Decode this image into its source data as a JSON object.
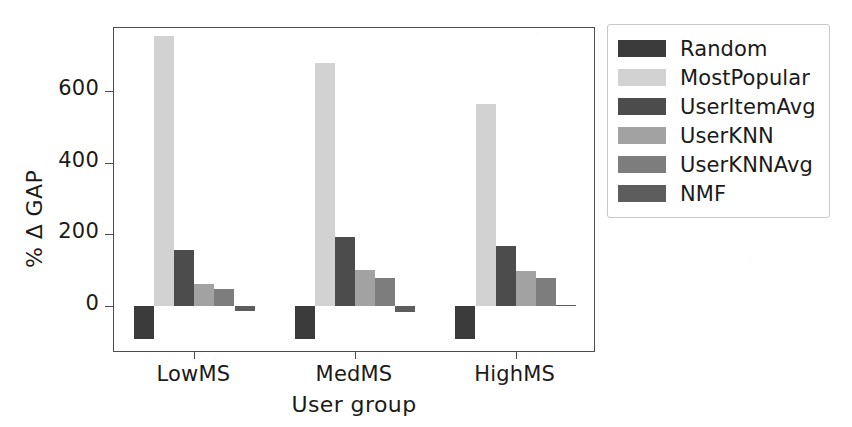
{
  "chart_data": {
    "type": "bar",
    "title": "",
    "xlabel": "User group",
    "ylabel": "% Δ GAP",
    "categories": [
      "LowMS",
      "MedMS",
      "HighMS"
    ],
    "yticks": [
      0,
      200,
      400,
      600
    ],
    "ylim": [
      -130,
      775
    ],
    "grid": false,
    "legend_position": "right-outside",
    "series": [
      {
        "name": "Random",
        "color": "#3b3b3b",
        "values": [
          -92,
          -92,
          -92
        ]
      },
      {
        "name": "MostPopular",
        "color": "#d2d2d2",
        "values": [
          753,
          678,
          564
        ]
      },
      {
        "name": "UserItemAvg",
        "color": "#4c4c4c",
        "values": [
          156,
          192,
          168
        ]
      },
      {
        "name": "UserKNN",
        "color": "#a2a2a2",
        "values": [
          62,
          100,
          97
        ]
      },
      {
        "name": "UserKNNAvg",
        "color": "#7d7d7d",
        "values": [
          48,
          80,
          80
        ]
      },
      {
        "name": "NMF",
        "color": "#5d5d5d",
        "values": [
          -12,
          -16,
          3
        ]
      }
    ]
  },
  "axis": {
    "ytick_labels": [
      "0",
      "200",
      "400",
      "600"
    ],
    "xtick_labels": [
      "LowMS",
      "MedMS",
      "HighMS"
    ],
    "ylabel_text": "% Δ GAP",
    "xlabel_text": "User group"
  },
  "legend": {
    "items": [
      {
        "label": "Random",
        "color": "#3b3b3b"
      },
      {
        "label": "MostPopular",
        "color": "#d2d2d2"
      },
      {
        "label": "UserItemAvg",
        "color": "#4c4c4c"
      },
      {
        "label": "UserKNN",
        "color": "#a2a2a2"
      },
      {
        "label": "UserKNNAvg",
        "color": "#7d7d7d"
      },
      {
        "label": "NMF",
        "color": "#5d5d5d"
      }
    ]
  },
  "colors": {
    "axis": "#4d4d4d",
    "text": "#1a1a1a",
    "legend_border": "#c9c9c9",
    "background": "#ffffff"
  }
}
